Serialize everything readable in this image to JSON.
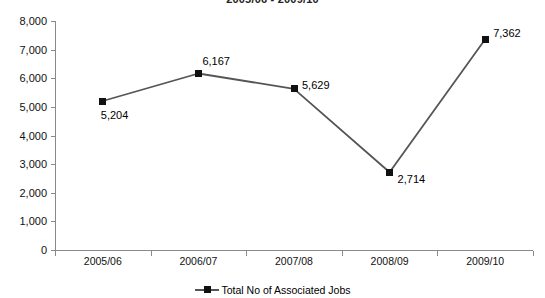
{
  "chart_data": {
    "type": "line",
    "title": "2005/06 - 2009/10",
    "xlabel": "",
    "ylabel": "",
    "categories": [
      "2005/06",
      "2006/07",
      "2007/08",
      "2008/09",
      "2009/10"
    ],
    "series": [
      {
        "name": "Total No of Associated Jobs",
        "values": [
          5204,
          6167,
          5629,
          2714,
          7362
        ],
        "value_labels": [
          "5,204",
          "6,167",
          "5,629",
          "2,714",
          "7,362"
        ],
        "marker": "square",
        "marker_color": "#111111",
        "line_color": "#555555"
      }
    ],
    "ylim": [
      0,
      8000
    ],
    "ytick_values": [
      0,
      1000,
      2000,
      3000,
      4000,
      5000,
      6000,
      7000,
      8000
    ],
    "ytick_labels": [
      "0",
      "1,000",
      "2,000",
      "3,000",
      "4,000",
      "5,000",
      "6,000",
      "7,000",
      "8,000"
    ],
    "grid": false,
    "legend_position": "bottom"
  },
  "legend": {
    "entries": [
      {
        "label": "Total No of Associated Jobs",
        "color": "#555555",
        "marker_color": "#111111"
      }
    ]
  },
  "colors": {
    "line": "#555555",
    "marker": "#111111",
    "axis": "#8a8a8a",
    "text": "#111111",
    "background": "#ffffff"
  }
}
